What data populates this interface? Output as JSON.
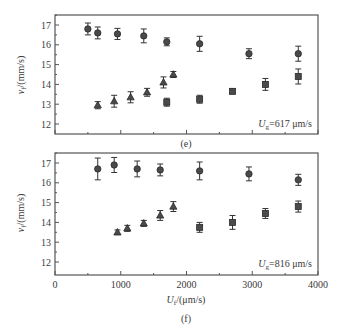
{
  "chart_data": [
    {
      "type": "scatter",
      "panel_label": "(e)",
      "annotation": {
        "prefix": "U",
        "sub": "g",
        "suffix": "=617 μm/s"
      },
      "xlabel": "",
      "ylabel": {
        "main": "v",
        "sub": "f",
        "unit": "/(mm/s)"
      },
      "xlim": [
        0,
        4000
      ],
      "ylim": [
        11.5,
        17.5
      ],
      "xticks": [
        0,
        1000,
        2000,
        3000,
        4000
      ],
      "xtick_labels_shown": false,
      "yticks": [
        12,
        13,
        14,
        15,
        16,
        17
      ],
      "ytick_labels": [
        "12",
        "13",
        "14",
        "15",
        "16",
        "17"
      ],
      "grid": false,
      "series": [
        {
          "name": "circles",
          "marker": "circle",
          "x": [
            500,
            650,
            950,
            1350,
            1700,
            2200,
            2950,
            3700
          ],
          "y": [
            16.8,
            16.6,
            16.55,
            16.45,
            16.15,
            16.05,
            15.55,
            15.55
          ],
          "err": [
            0.3,
            0.3,
            0.28,
            0.35,
            0.2,
            0.38,
            0.25,
            0.38
          ]
        },
        {
          "name": "triangles",
          "marker": "triangle",
          "x": [
            650,
            900,
            1150,
            1400,
            1650,
            1800
          ],
          "y": [
            12.95,
            13.15,
            13.35,
            13.6,
            14.1,
            14.5
          ],
          "err": [
            0.18,
            0.3,
            0.28,
            0.2,
            0.28,
            0.15
          ]
        },
        {
          "name": "squares",
          "marker": "square",
          "x": [
            1700,
            2200,
            2700,
            3200,
            3700
          ],
          "y": [
            13.1,
            13.25,
            13.65,
            14.0,
            14.4
          ],
          "err": [
            0.2,
            0.2,
            0.12,
            0.3,
            0.38
          ]
        }
      ]
    },
    {
      "type": "scatter",
      "panel_label": "(f)",
      "annotation": {
        "prefix": "U",
        "sub": "g",
        "suffix": "=816 μm/s"
      },
      "xlabel": {
        "main": "U",
        "sub": "f",
        "unit": "/(μm/s)"
      },
      "ylabel": {
        "main": "v",
        "sub": "f",
        "unit": "/(mm/s)"
      },
      "xlim": [
        0,
        4000
      ],
      "ylim": [
        11.5,
        17.5
      ],
      "xticks": [
        0,
        1000,
        2000,
        3000,
        4000
      ],
      "xtick_labels": [
        "0",
        "1000",
        "2000",
        "3000",
        "4000"
      ],
      "xtick_labels_shown": true,
      "yticks": [
        12,
        13,
        14,
        15,
        16,
        17
      ],
      "ytick_labels": [
        "12",
        "13",
        "14",
        "15",
        "16",
        "17"
      ],
      "grid": false,
      "series": [
        {
          "name": "circles",
          "marker": "circle",
          "x": [
            650,
            900,
            1250,
            1600,
            2200,
            2950,
            3700
          ],
          "y": [
            16.7,
            16.9,
            16.7,
            16.65,
            16.6,
            16.45,
            16.15
          ],
          "err": [
            0.55,
            0.38,
            0.4,
            0.3,
            0.45,
            0.35,
            0.28
          ]
        },
        {
          "name": "triangles",
          "marker": "triangle",
          "x": [
            950,
            1100,
            1350,
            1600,
            1800
          ],
          "y": [
            13.5,
            13.7,
            13.95,
            14.35,
            14.8
          ],
          "err": [
            0.12,
            0.15,
            0.15,
            0.25,
            0.25
          ]
        },
        {
          "name": "squares",
          "marker": "square",
          "x": [
            2200,
            2700,
            3200,
            3700
          ],
          "y": [
            13.75,
            14.0,
            14.45,
            14.8
          ],
          "err": [
            0.25,
            0.35,
            0.25,
            0.28
          ]
        }
      ]
    }
  ]
}
